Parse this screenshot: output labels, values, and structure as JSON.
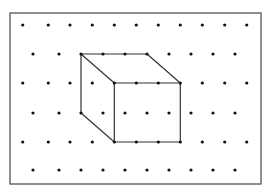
{
  "diagram": {
    "colors": {
      "background": "#ffffff",
      "border": "#555555",
      "dot": "#111111",
      "line": "#333333"
    },
    "frame": {
      "x": 10,
      "y": 13,
      "width": 251,
      "height": 171
    },
    "dot_radius": 1.6,
    "grid": {
      "rows": [
        {
          "y": 25,
          "xs": [
            22.7,
            48.3,
            70,
            92.3,
            114.3,
            136.3,
            158.3,
            180.3,
            202.3,
            224.7,
            246.7
          ]
        },
        {
          "y": 54,
          "xs": [
            33,
            59,
            81,
            103,
            125,
            147,
            169,
            191,
            213,
            235
          ]
        },
        {
          "y": 83,
          "xs": [
            22.7,
            48.3,
            70,
            92.3,
            114.3,
            136.3,
            158.3,
            180.3,
            202.3,
            224.7,
            246.7
          ]
        },
        {
          "y": 113,
          "xs": [
            33,
            59,
            81,
            103,
            125,
            147,
            169,
            191,
            213,
            235
          ]
        },
        {
          "y": 142,
          "xs": [
            22.7,
            48.3,
            70,
            92.3,
            114.3,
            136.3,
            158.3,
            180.3,
            202.3,
            224.7,
            246.7
          ]
        },
        {
          "y": 170,
          "xs": [
            33,
            59,
            81,
            103,
            125,
            147,
            169,
            191,
            213,
            235
          ]
        }
      ]
    },
    "cube": {
      "edges": [
        {
          "name": "top-back-edge",
          "x1": 81,
          "y1": 54,
          "x2": 147,
          "y2": 54
        },
        {
          "name": "top-left-diagonal",
          "x1": 81,
          "y1": 54,
          "x2": 114.3,
          "y2": 83
        },
        {
          "name": "top-right-diagonal",
          "x1": 147,
          "y1": 54,
          "x2": 180.3,
          "y2": 83
        },
        {
          "name": "back-left-vertical",
          "x1": 81,
          "y1": 54,
          "x2": 81,
          "y2": 113
        },
        {
          "name": "bottom-left-diagonal",
          "x1": 81,
          "y1": 113,
          "x2": 114.3,
          "y2": 142
        },
        {
          "name": "front-top-edge",
          "x1": 114.3,
          "y1": 83,
          "x2": 180.3,
          "y2": 83
        },
        {
          "name": "front-left-edge",
          "x1": 114.3,
          "y1": 83,
          "x2": 114.3,
          "y2": 142
        },
        {
          "name": "front-right-edge",
          "x1": 180.3,
          "y1": 83,
          "x2": 180.3,
          "y2": 142
        },
        {
          "name": "front-bottom-edge",
          "x1": 114.3,
          "y1": 142,
          "x2": 180.3,
          "y2": 142
        }
      ]
    }
  }
}
